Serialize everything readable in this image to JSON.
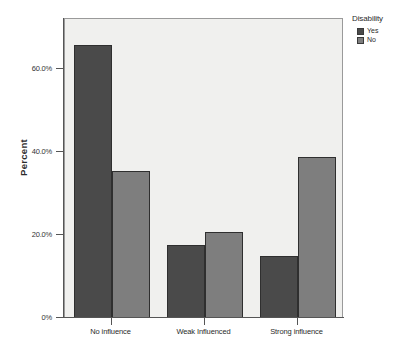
{
  "chart_data": {
    "type": "bar",
    "title": "",
    "xlabel": "",
    "ylabel": "Percent",
    "categories": [
      "No influence",
      "Weak Influenced",
      "Strong influence"
    ],
    "series": [
      {
        "name": "Yes",
        "color": "#4a4a4a",
        "values": [
          65.8,
          17.5,
          15.0
        ]
      },
      {
        "name": "No",
        "color": "#7e7e7e",
        "values": [
          35.4,
          20.6,
          38.8
        ]
      }
    ],
    "ylim": [
      0,
      72
    ],
    "yticks": [
      0,
      20,
      40,
      60
    ],
    "ytick_labels": [
      "0%",
      "20.0%",
      "40.0%",
      "60.0%"
    ],
    "grid": false,
    "legend": {
      "title": "Disability",
      "position": "right",
      "entries": [
        "Yes",
        "No"
      ]
    },
    "plot_background": "#f0f0ee",
    "axis_color": "#555555"
  }
}
